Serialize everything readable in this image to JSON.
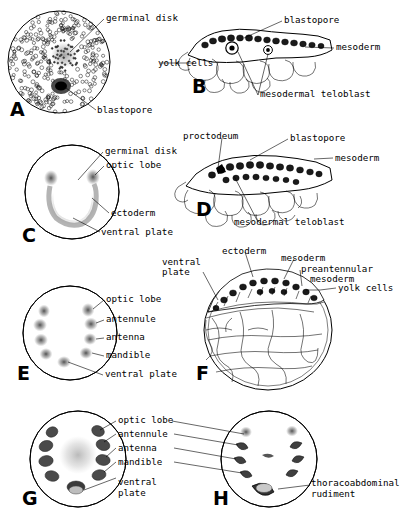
{
  "figure": {
    "type": "scientific-plate",
    "background_color": "#ffffff",
    "ink_color": "#000000"
  },
  "panels": [
    {
      "id": "A",
      "letter": "A",
      "view": "surface-whole-mount",
      "labels": [
        {
          "key": "germinal_disk",
          "text": "germinal disk"
        },
        {
          "key": "blastopore",
          "text": "blastopore"
        }
      ]
    },
    {
      "id": "B",
      "letter": "B",
      "view": "sagittal-section",
      "labels": [
        {
          "key": "blastopore",
          "text": "blastopore"
        },
        {
          "key": "mesoderm",
          "text": "mesoderm"
        },
        {
          "key": "yolk_cells",
          "text": "yolk cells"
        },
        {
          "key": "mesodermal_teloblast",
          "text": "mesodermal teloblast"
        }
      ]
    },
    {
      "id": "C",
      "letter": "C",
      "view": "surface-whole-mount",
      "labels": [
        {
          "key": "germinal_disk",
          "text": "germinal disk"
        },
        {
          "key": "optic_lobe",
          "text": "optic lobe"
        },
        {
          "key": "ectoderm",
          "text": "ectoderm"
        },
        {
          "key": "ventral_plate",
          "text": "ventral plate"
        }
      ]
    },
    {
      "id": "D",
      "letter": "D",
      "view": "sagittal-section",
      "labels": [
        {
          "key": "proctodeum",
          "text": "proctodeum"
        },
        {
          "key": "blastopore",
          "text": "blastopore"
        },
        {
          "key": "mesoderm",
          "text": "mesoderm"
        },
        {
          "key": "mesodermal_teloblast",
          "text": "mesodermal teloblast"
        }
      ]
    },
    {
      "id": "E",
      "letter": "E",
      "view": "surface-whole-mount",
      "labels": [
        {
          "key": "optic_lobe",
          "text": "optic lobe"
        },
        {
          "key": "antennule",
          "text": "antennule"
        },
        {
          "key": "antenna",
          "text": "antenna"
        },
        {
          "key": "mandible",
          "text": "mandible"
        },
        {
          "key": "ventral_plate",
          "text": "ventral plate"
        }
      ]
    },
    {
      "id": "F",
      "letter": "F",
      "view": "sagittal-section",
      "labels": [
        {
          "key": "ectoderm",
          "text": "ectoderm"
        },
        {
          "key": "mesoderm",
          "text": "mesoderm"
        },
        {
          "key": "preantennular_mesoderm_line1",
          "text": "preantennular"
        },
        {
          "key": "preantennular_mesoderm_line2",
          "text": "mesoderm"
        },
        {
          "key": "ventral_plate_line1",
          "text": "ventral"
        },
        {
          "key": "ventral_plate_line2",
          "text": "plate"
        },
        {
          "key": "yolk_cells",
          "text": "yolk cells"
        }
      ]
    },
    {
      "id": "G",
      "letter": "G",
      "view": "surface-whole-mount",
      "labels": [
        {
          "key": "optic_lobe",
          "text": "optic lobe"
        },
        {
          "key": "antennule",
          "text": "antennule"
        },
        {
          "key": "antenna",
          "text": "antenna"
        },
        {
          "key": "mandible",
          "text": "mandible"
        },
        {
          "key": "ventral_plate_line1",
          "text": "ventral"
        },
        {
          "key": "ventral_plate_line2",
          "text": "plate"
        }
      ]
    },
    {
      "id": "H",
      "letter": "H",
      "view": "surface-whole-mount",
      "labels": [
        {
          "key": "thoracoabdominal_line1",
          "text": "thoracoabdominal"
        },
        {
          "key": "thoracoabdominal_line2",
          "text": "rudiment"
        }
      ]
    }
  ]
}
